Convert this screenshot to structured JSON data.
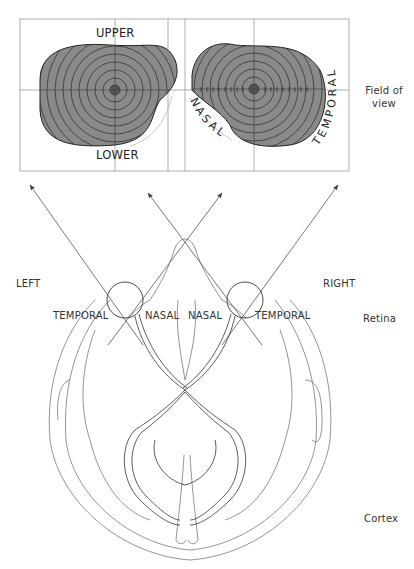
{
  "field_of_view": {
    "label_line1": "Field of",
    "label_line2": "view",
    "left_eye": {
      "upper": "UPPER",
      "lower": "LOWER"
    },
    "right_eye": {
      "nasal": "NASAL",
      "temporal": "TEMPORAL",
      "scale_left": [
        "80",
        "70",
        "60",
        "50",
        "40",
        "30",
        "20",
        "10"
      ],
      "scale_right": [
        "10",
        "20",
        "30",
        "40",
        "50",
        "60",
        "70",
        "80"
      ]
    },
    "colors": {
      "field_fill": "#8a8a8a",
      "grid_line": "#999999",
      "contour": "#222222"
    }
  },
  "anatomy": {
    "left": "LEFT",
    "right": "RIGHT",
    "temporal_left": "TEMPORAL",
    "nasal_left": "NASAL",
    "nasal_right": "NASAL",
    "temporal_right": "TEMPORAL",
    "retina": "Retina",
    "cortex": "Cortex"
  }
}
